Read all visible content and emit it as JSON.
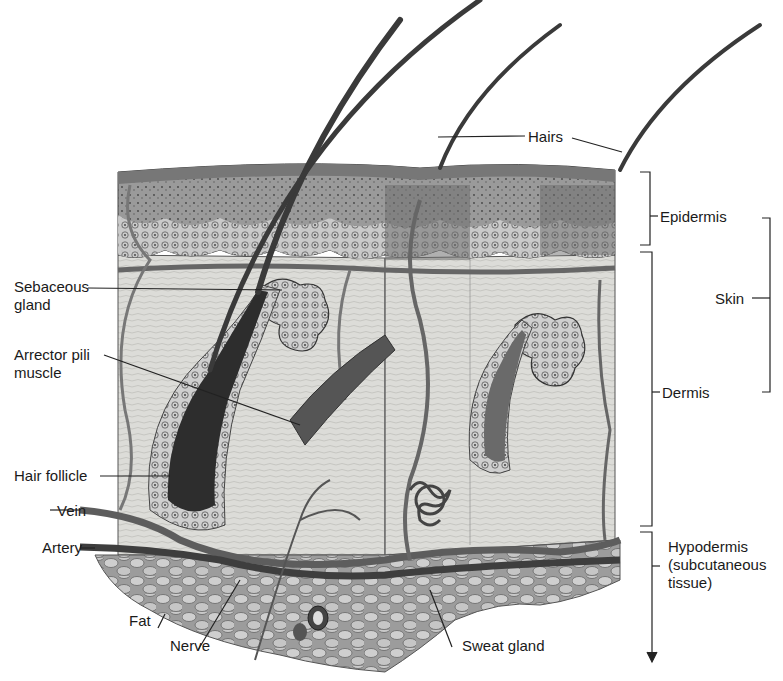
{
  "figure": {
    "colors": {
      "background": "#ffffff",
      "ink": "#1a1a1a",
      "epidermis": "#8a8a8a",
      "dermis": "#d9d9d6",
      "hypodermis_fat": "#bdbdbd",
      "hair": "#3a3a3a",
      "vessel": "#6e6e6e"
    }
  },
  "labels": {
    "hairs": "Hairs",
    "epidermis": "Epidermis",
    "skin": "Skin",
    "dermis": "Dermis",
    "hypodermis": "Hypodermis\n(subcutaneous\ntissue)",
    "sebaceous_gland": "Sebaceous\ngland",
    "arrector_pili": "Arrector pili\nmuscle",
    "hair_follicle": "Hair follicle",
    "vein": "Vein",
    "artery": "Artery",
    "fat": "Fat",
    "nerve": "Nerve",
    "sweat_gland": "Sweat gland"
  }
}
